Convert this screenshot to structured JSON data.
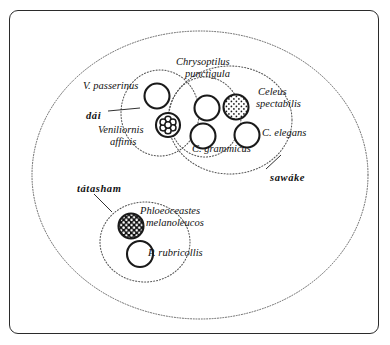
{
  "figure": {
    "type": "venn-taxonomy-diagram",
    "frame": {
      "border_color": "#2b2b2b",
      "background": "#ffffff"
    }
  },
  "sets": [
    {
      "id": "outer",
      "name": "outer-boundary-ellipse",
      "style": "dotted",
      "cx": 200,
      "cy": 175,
      "rx": 168,
      "ry": 144
    },
    {
      "id": "dai",
      "name": "dai-group-ellipse",
      "label": "dái",
      "style": "dotted",
      "cx": 160,
      "cy": 113,
      "rx": 39,
      "ry": 43
    },
    {
      "id": "sawake",
      "name": "sawake-group-ellipse",
      "label": "sawáke",
      "style": "dotted",
      "cx": 230,
      "cy": 120,
      "rx": 62,
      "ry": 54
    },
    {
      "id": "chrysoptilus",
      "name": "chrysoptilus-group-ellipse",
      "label": "Chrysoptilus punctigula",
      "style": "dotted",
      "cx": 205,
      "cy": 117,
      "rx": 36,
      "ry": 40
    },
    {
      "id": "tatasham",
      "name": "tatasham-group-ellipse",
      "label": "tátasham",
      "style": "dotted",
      "cx": 145,
      "cy": 242,
      "rx": 45,
      "ry": 40
    }
  ],
  "species_circles": [
    {
      "id": "v_passerinus",
      "name": "circle-v-passerinus",
      "fill": "plain",
      "cx": 157,
      "cy": 96,
      "r": 12.5
    },
    {
      "id": "veniliornis",
      "name": "circle-veniliornis-affinis",
      "fill": "rosette",
      "cx": 168,
      "cy": 125,
      "r": 12.0
    },
    {
      "id": "chrys_upper",
      "name": "circle-chrysoptilus-upper",
      "fill": "plain",
      "cx": 207,
      "cy": 108,
      "r": 12.5
    },
    {
      "id": "c_grammicus",
      "name": "circle-c-grammicus",
      "fill": "plain",
      "cx": 203,
      "cy": 136,
      "r": 12.5
    },
    {
      "id": "celeus_spect",
      "name": "circle-celeus-spectabilis",
      "fill": "stipple-dark",
      "cx": 236,
      "cy": 107,
      "r": 12.5
    },
    {
      "id": "c_elegans",
      "name": "circle-c-elegans",
      "fill": "plain",
      "cx": 247,
      "cy": 135,
      "r": 12.5
    },
    {
      "id": "melanoleucos",
      "name": "circle-phloeoceastes-melanoleucos",
      "fill": "black-dots",
      "cx": 131,
      "cy": 226,
      "r": 12.5
    },
    {
      "id": "p_rubricollis",
      "name": "circle-p-rubricollis",
      "fill": "plain",
      "cx": 140,
      "cy": 254,
      "r": 13.0
    }
  ],
  "labels": {
    "v_passerinus": {
      "text": "V. passerinus",
      "kind": "scientific",
      "x": 83,
      "y": 80
    },
    "dai": {
      "text": "dái",
      "kind": "vernacular",
      "x": 86,
      "y": 110
    },
    "veniliornis_1": {
      "text": "Veniliornis",
      "kind": "scientific",
      "x": 98,
      "y": 124
    },
    "veniliornis_2": {
      "text": "affinis",
      "kind": "scientific",
      "x": 110,
      "y": 136
    },
    "chrysoptilus_1": {
      "text": "Chrysoptilus",
      "kind": "scientific",
      "x": 176,
      "y": 56
    },
    "chrysoptilus_2": {
      "text": "punctigula",
      "kind": "scientific",
      "x": 185,
      "y": 68
    },
    "celeus_1": {
      "text": "Celeus",
      "kind": "scientific",
      "x": 258,
      "y": 86
    },
    "celeus_2": {
      "text": "spectabilis",
      "kind": "scientific",
      "x": 256,
      "y": 98
    },
    "c_elegans": {
      "text": "C. elegans",
      "kind": "scientific",
      "x": 262,
      "y": 127
    },
    "c_grammicus": {
      "text": "C. grammicus",
      "kind": "scientific",
      "x": 192,
      "y": 143
    },
    "sawake": {
      "text": "sawáke",
      "kind": "vernacular",
      "x": 270,
      "y": 172
    },
    "tatasham": {
      "text": "tátasham",
      "kind": "vernacular",
      "x": 77,
      "y": 183
    },
    "phloeoceastes_1": {
      "text": "Phloeoceastes",
      "kind": "scientific",
      "x": 140,
      "y": 205
    },
    "phloeoceastes_2": {
      "text": "melanoleucos",
      "kind": "scientific",
      "x": 146,
      "y": 217
    },
    "p_rubricollis": {
      "text": "P. rubricollis",
      "kind": "scientific",
      "x": 148,
      "y": 247
    }
  },
  "leader_lines": [
    {
      "name": "leader-line-dai",
      "x1": 108,
      "y1": 111,
      "x2": 140,
      "y2": 108
    },
    {
      "name": "leader-line-sawake",
      "x1": 266,
      "y1": 169,
      "x2": 281,
      "y2": 155
    },
    {
      "name": "leader-line-tatasham",
      "x1": 94,
      "y1": 194,
      "x2": 112,
      "y2": 212
    }
  ],
  "colors": {
    "line": "#1a1a1a",
    "dotted": "#555555",
    "text": "#111111",
    "background": "#ffffff"
  }
}
